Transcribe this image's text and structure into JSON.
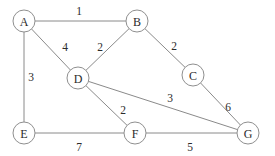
{
  "figure": {
    "kind": "weighted-undirected-graph",
    "width": 275,
    "height": 156,
    "background_color": "#ffffff",
    "edge_color": "#8a8a8a",
    "node_stroke_color": "#8f8f8f",
    "node_fill_color": "#ffffff",
    "text_color": "#2b2b2b"
  },
  "chart_data": {
    "type": "diagram",
    "title": "",
    "xlabel": "",
    "ylabel": "",
    "nodes": [
      {
        "id": "A",
        "label": "A",
        "x": 24,
        "y": 21,
        "r": 11
      },
      {
        "id": "B",
        "label": "B",
        "x": 137,
        "y": 21,
        "r": 11
      },
      {
        "id": "C",
        "label": "C",
        "x": 193,
        "y": 75,
        "r": 11
      },
      {
        "id": "D",
        "label": "D",
        "x": 78,
        "y": 78,
        "r": 11
      },
      {
        "id": "E",
        "label": "E",
        "x": 24,
        "y": 133,
        "r": 11
      },
      {
        "id": "F",
        "label": "F",
        "x": 135,
        "y": 133,
        "r": 11
      },
      {
        "id": "G",
        "label": "G",
        "x": 248,
        "y": 133,
        "r": 11
      }
    ],
    "edges": [
      {
        "source": "A",
        "target": "B",
        "weight": 1,
        "label": "1",
        "lx": 79,
        "ly": 11
      },
      {
        "source": "A",
        "target": "D",
        "weight": 4,
        "label": "4",
        "lx": 65,
        "ly": 47
      },
      {
        "source": "A",
        "target": "E",
        "weight": 3,
        "label": "3",
        "lx": 31,
        "ly": 77
      },
      {
        "source": "B",
        "target": "D",
        "weight": 2,
        "label": "2",
        "lx": 100,
        "ly": 47
      },
      {
        "source": "B",
        "target": "C",
        "weight": 2,
        "label": "2",
        "lx": 174,
        "ly": 46
      },
      {
        "source": "C",
        "target": "G",
        "weight": 6,
        "label": "6",
        "lx": 228,
        "ly": 107
      },
      {
        "source": "D",
        "target": "G",
        "weight": 3,
        "label": "3",
        "lx": 170,
        "ly": 98
      },
      {
        "source": "D",
        "target": "F",
        "weight": 2,
        "label": "2",
        "lx": 123,
        "ly": 110
      },
      {
        "source": "E",
        "target": "F",
        "weight": 7,
        "label": "7",
        "lx": 79,
        "ly": 147
      },
      {
        "source": "F",
        "target": "G",
        "weight": 5,
        "label": "5",
        "lx": 190,
        "ly": 147
      }
    ]
  }
}
